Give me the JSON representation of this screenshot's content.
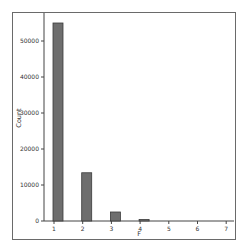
{
  "chart_data": {
    "type": "bar",
    "title": "",
    "xlabel": "F",
    "ylabel": "Count",
    "categories": [
      "1",
      "2",
      "3",
      "4",
      "5",
      "6",
      "7"
    ],
    "values": [
      55000,
      13400,
      2500,
      400,
      0,
      0,
      0
    ],
    "ylim": [
      0,
      58000
    ],
    "yticks": [
      0,
      10000,
      20000,
      30000,
      40000,
      50000
    ],
    "ytick_labels": [
      "0",
      "10000",
      "20000",
      "30000",
      "40000",
      "50000"
    ],
    "grid": false,
    "legend": null,
    "bar_color": "#6e6e6e",
    "bar_edge_color": "#3a3a3a"
  }
}
